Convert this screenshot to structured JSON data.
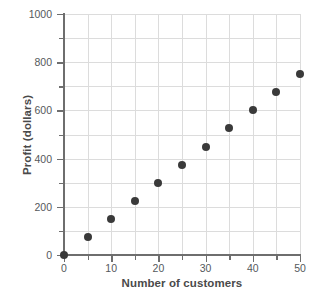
{
  "chart_data": {
    "type": "scatter",
    "title": "",
    "xlabel": "Number of customers",
    "ylabel": "Profit (dollars)",
    "xlim": [
      0,
      50
    ],
    "ylim": [
      0,
      1000
    ],
    "grid": true,
    "legend": null,
    "x_major_ticks": [
      0,
      10,
      20,
      30,
      40,
      50
    ],
    "x_minor_ticks": [
      5,
      15,
      25,
      35,
      45
    ],
    "y_major_ticks": [
      0,
      200,
      400,
      600,
      800,
      1000
    ],
    "y_minor_ticks": [
      100,
      300,
      500,
      700,
      900
    ],
    "x_ticklabels": [
      "0",
      "10",
      "20",
      "30",
      "40",
      "50"
    ],
    "y_ticklabels": [
      "0",
      "200",
      "400",
      "600",
      "800",
      "1000"
    ],
    "marker_color": "#3a3a3a",
    "grid_color": "#dcdcdc",
    "axis_color": "#6e6e6e",
    "x": [
      0,
      5,
      10,
      15,
      20,
      25,
      30,
      35,
      40,
      45,
      50
    ],
    "y": [
      0,
      75,
      150,
      225,
      300,
      375,
      450,
      525,
      600,
      675,
      750
    ],
    "points": [
      {
        "x": 0,
        "y": 0
      },
      {
        "x": 5,
        "y": 75
      },
      {
        "x": 10,
        "y": 150
      },
      {
        "x": 15,
        "y": 225
      },
      {
        "x": 20,
        "y": 300
      },
      {
        "x": 25,
        "y": 375
      },
      {
        "x": 30,
        "y": 450
      },
      {
        "x": 35,
        "y": 525
      },
      {
        "x": 40,
        "y": 600
      },
      {
        "x": 45,
        "y": 675
      },
      {
        "x": 50,
        "y": 750
      }
    ]
  }
}
